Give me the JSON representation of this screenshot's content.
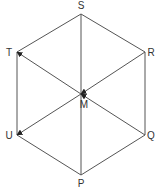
{
  "diagram": {
    "colors": {
      "line": "#555555",
      "text": "#333333",
      "background": "#ffffff"
    },
    "vertices": {
      "S": {
        "label": "S",
        "x": 81,
        "y": 14,
        "lx": 81,
        "ly": 9
      },
      "R": {
        "label": "R",
        "x": 145,
        "y": 52,
        "lx": 151,
        "ly": 56
      },
      "Q": {
        "label": "Q",
        "x": 145,
        "y": 135,
        "lx": 151,
        "ly": 139
      },
      "P": {
        "label": "P",
        "x": 81,
        "y": 175,
        "lx": 81,
        "ly": 187
      },
      "U": {
        "label": "U",
        "x": 17,
        "y": 135,
        "lx": 9,
        "ly": 139
      },
      "T": {
        "label": "T",
        "x": 17,
        "y": 52,
        "lx": 9,
        "ly": 56
      },
      "M": {
        "label": "M",
        "x": 81,
        "y": 94,
        "lx": 84,
        "ly": 108
      }
    },
    "edges": [
      [
        "S",
        "R"
      ],
      [
        "R",
        "Q"
      ],
      [
        "Q",
        "P"
      ],
      [
        "P",
        "U"
      ],
      [
        "U",
        "T"
      ],
      [
        "T",
        "S"
      ],
      [
        "S",
        "P"
      ]
    ],
    "vectors": [
      {
        "from": "M",
        "to": "T"
      },
      {
        "from": "M",
        "to": "U"
      },
      {
        "from": "R",
        "to": "M"
      },
      {
        "from": "Q",
        "to": "M"
      }
    ]
  }
}
